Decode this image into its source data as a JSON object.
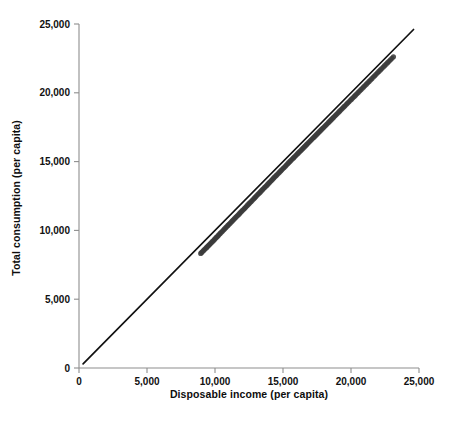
{
  "chart_data": {
    "type": "scatter",
    "title": "",
    "subtitle": "",
    "xlabel": "Disposable income (per capita)",
    "ylabel": "Total consumption (per capita)",
    "xlim": [
      0,
      25000
    ],
    "ylim": [
      0,
      25000
    ],
    "xticks": [
      0,
      5000,
      10000,
      15000,
      20000,
      25000
    ],
    "yticks": [
      0,
      5000,
      10000,
      15000,
      20000,
      25000
    ],
    "xtick_labels": [
      "0",
      "5,000",
      "10,000",
      "15,000",
      "20,000",
      "25,000"
    ],
    "ytick_labels": [
      "0",
      "5,000",
      "10,000",
      "15,000",
      "20,000",
      "25,000"
    ],
    "grid": false,
    "legend": null,
    "legend_position": "none",
    "annotations": [],
    "marker_color": "#3b3b3b",
    "reference_line": {
      "name": "45-degree line",
      "color": "#111111",
      "x": [
        300,
        24600
      ],
      "y": [
        300,
        24600
      ],
      "slope": 1,
      "intercept": 0
    },
    "series": [
      {
        "name": "Consumption vs disposable income",
        "marker": "circle",
        "x": [
          8950,
          9020,
          9100,
          9180,
          9260,
          9350,
          9420,
          9500,
          9560,
          9630,
          9700,
          9780,
          9850,
          9930,
          10000,
          10080,
          10150,
          10230,
          10300,
          10380,
          10460,
          10540,
          10620,
          10700,
          10790,
          10870,
          10950,
          11030,
          11110,
          11190,
          11270,
          11350,
          11430,
          11520,
          11600,
          11680,
          11760,
          11840,
          11920,
          12000,
          12090,
          12170,
          12250,
          12330,
          12410,
          12500,
          12580,
          12660,
          12740,
          12830,
          12910,
          12990,
          13070,
          13160,
          13240,
          13320,
          13400,
          13490,
          13570,
          13650,
          13740,
          13820,
          13900,
          13990,
          14070,
          14150,
          14240,
          14320,
          14400,
          14490,
          14570,
          14660,
          14740,
          14830,
          14910,
          15000,
          15080,
          15170,
          15250,
          15340,
          15420,
          15510,
          15590,
          15680,
          15770,
          15850,
          15940,
          16030,
          16110,
          16200,
          16290,
          16370,
          16460,
          16550,
          16640,
          16730,
          16810,
          16900,
          16990,
          17080,
          17170,
          17260,
          17350,
          17440,
          17530,
          17620,
          17710,
          17800,
          17890,
          17980,
          18070,
          18160,
          18250,
          18350,
          18440,
          18530,
          18620,
          18710,
          18810,
          18900,
          18990,
          19090,
          19180,
          19280,
          19370,
          19470,
          19560,
          19660,
          19750,
          19850,
          19950,
          20040,
          20140,
          20240,
          20330,
          20430,
          20530,
          20630,
          20730,
          20830,
          20930,
          21030,
          21130,
          21230,
          21330,
          21430,
          21530,
          21640,
          21740,
          21840,
          21950,
          22050,
          22160,
          22260,
          22370,
          22470,
          22580,
          22690,
          22790,
          22900,
          23010,
          23120
        ],
        "y": [
          8330,
          8400,
          8480,
          8560,
          8640,
          8730,
          8800,
          8880,
          8940,
          9010,
          9080,
          9160,
          9230,
          9310,
          9390,
          9470,
          9540,
          9620,
          9700,
          9780,
          9860,
          9940,
          10020,
          10110,
          10200,
          10280,
          10360,
          10440,
          10520,
          10610,
          10690,
          10770,
          10850,
          10940,
          11020,
          11100,
          11180,
          11270,
          11350,
          11430,
          11520,
          11600,
          11680,
          11770,
          11850,
          11940,
          12020,
          12100,
          12190,
          12280,
          12360,
          12440,
          12530,
          12620,
          12700,
          12780,
          12870,
          12960,
          13040,
          13120,
          13210,
          13290,
          13380,
          13470,
          13550,
          13630,
          13720,
          13810,
          13890,
          13980,
          14060,
          14150,
          14230,
          14320,
          14400,
          14490,
          14570,
          14660,
          14750,
          14840,
          14920,
          15010,
          15090,
          15180,
          15270,
          15350,
          15440,
          15530,
          15610,
          15700,
          15790,
          15870,
          15960,
          16050,
          16140,
          16230,
          16310,
          16400,
          16490,
          16580,
          16670,
          16760,
          16850,
          16940,
          17030,
          17120,
          17210,
          17300,
          17390,
          17480,
          17570,
          17660,
          17750,
          17850,
          17940,
          18030,
          18120,
          18210,
          18310,
          18400,
          18490,
          18590,
          18680,
          18780,
          18870,
          18970,
          19060,
          19160,
          19250,
          19350,
          19450,
          19540,
          19640,
          19740,
          19830,
          19930,
          20030,
          20130,
          20230,
          20330,
          20430,
          20530,
          20630,
          20730,
          20830,
          20930,
          21030,
          21140,
          21240,
          21340,
          21450,
          21550,
          21660,
          21760,
          21870,
          21970,
          22080,
          22190,
          22290,
          22400,
          22510,
          22620
        ]
      }
    ]
  }
}
